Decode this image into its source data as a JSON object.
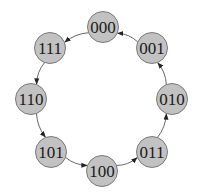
{
  "diagram": {
    "type": "directed-cycle-graph",
    "node_radius": 15.5,
    "colors": {
      "node_fill": "#c2c2c2",
      "node_stroke": "#7a7a7a",
      "edge": "#555555",
      "text": "#1a1a1a"
    },
    "nodes": [
      {
        "id": "000",
        "label": "000",
        "x": 103,
        "y": 27
      },
      {
        "id": "001",
        "label": "001",
        "x": 152,
        "y": 48
      },
      {
        "id": "010",
        "label": "010",
        "x": 172,
        "y": 99
      },
      {
        "id": "011",
        "label": "011",
        "x": 152,
        "y": 152
      },
      {
        "id": "100",
        "label": "100",
        "x": 102,
        "y": 171
      },
      {
        "id": "101",
        "label": "101",
        "x": 51,
        "y": 152
      },
      {
        "id": "110",
        "label": "110",
        "x": 31,
        "y": 99
      },
      {
        "id": "111",
        "label": "111",
        "x": 50,
        "y": 48
      }
    ],
    "edges": [
      {
        "from": "001",
        "to": "000"
      },
      {
        "from": "000",
        "to": "111"
      },
      {
        "from": "111",
        "to": "110"
      },
      {
        "from": "110",
        "to": "101"
      },
      {
        "from": "101",
        "to": "100"
      },
      {
        "from": "100",
        "to": "011"
      },
      {
        "from": "011",
        "to": "010"
      },
      {
        "from": "010",
        "to": "001"
      }
    ]
  }
}
